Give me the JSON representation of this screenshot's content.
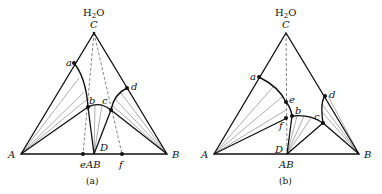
{
  "figure": {
    "panels": [
      {
        "id": "a",
        "caption": "(a)",
        "apex_label": "C",
        "apex_formula": "H2O",
        "apex_formula_main": "H",
        "apex_formula_sub": "2",
        "apex_formula_tail": "O",
        "left_vertex": "A",
        "right_vertex": "B",
        "compound": "AB",
        "compound_point": "D",
        "points": [
          "a",
          "b",
          "c",
          "d",
          "e",
          "f"
        ]
      },
      {
        "id": "b",
        "caption": "(b)",
        "apex_label": "C",
        "apex_formula": "H2O",
        "apex_formula_main": "H",
        "apex_formula_sub": "2",
        "apex_formula_tail": "O",
        "left_vertex": "A",
        "right_vertex": "B",
        "compound": "AB",
        "compound_point": "D",
        "points": [
          "a",
          "b",
          "c",
          "d",
          "e",
          "f"
        ]
      }
    ],
    "colors": {
      "line": "#111111",
      "tie_line": "#777777",
      "dashed": "#666666",
      "background": "#ffffff"
    }
  }
}
